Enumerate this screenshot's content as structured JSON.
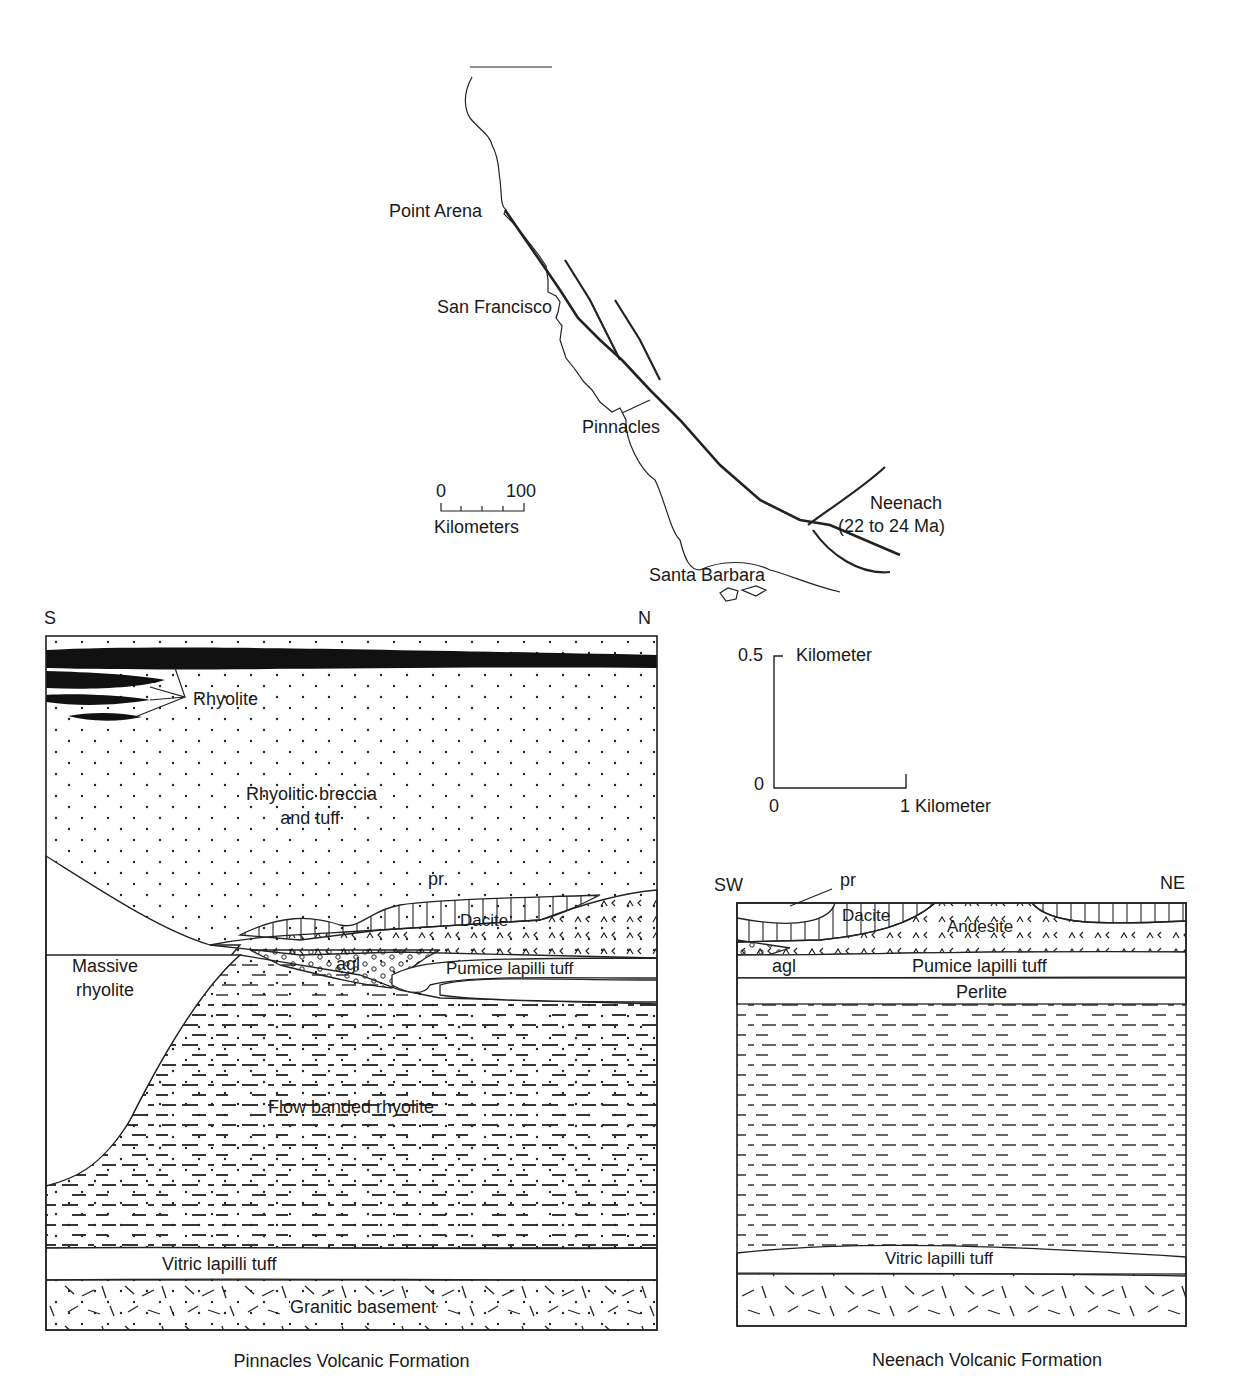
{
  "map": {
    "places": {
      "point_arena": "Point Arena",
      "san_francisco": "San Francisco",
      "pinnacles": "Pinnacles",
      "neenach": "Neenach",
      "neenach_age": "(22 to 24 Ma)",
      "santa_barbara": "Santa Barbara"
    },
    "scale": {
      "min": "0",
      "max": "100",
      "unit": "Kilometers"
    }
  },
  "section_scale": {
    "vertical_top": "0.5",
    "vertical_unit": "Kilometer",
    "vertical_bottom": "0",
    "horizontal_left": "0",
    "horizontal_right": "1 Kilometer"
  },
  "pinnacles_section": {
    "left_dir": "S",
    "right_dir": "N",
    "caption": "Pinnacles Volcanic Formation",
    "units": {
      "rhyolite": "Rhyolite",
      "breccia_1": "Rhyolitic breccia",
      "breccia_2": "and tuff",
      "pr": "pr",
      "dacite": "Dacite",
      "agl": "agl",
      "pumice": "Pumice lapilli tuff",
      "massive_1": "Massive",
      "massive_2": "rhyolite",
      "flow_banded": "Flow banded rhyolite",
      "vitric": "Vitric lapilli tuff",
      "granitic": "Granitic basement"
    }
  },
  "neenach_section": {
    "left_dir": "SW",
    "right_dir": "NE",
    "caption": "Neenach Volcanic Formation",
    "units": {
      "pr": "pr",
      "dacite": "Dacite",
      "andesite": "Andesite",
      "agl": "agl",
      "pumice": "Pumice lapilli tuff",
      "perlite": "Perlite",
      "vitric": "Vitric lapilli tuff"
    }
  },
  "colors": {
    "ink": "#1a1a1a",
    "paper": "#ffffff"
  }
}
